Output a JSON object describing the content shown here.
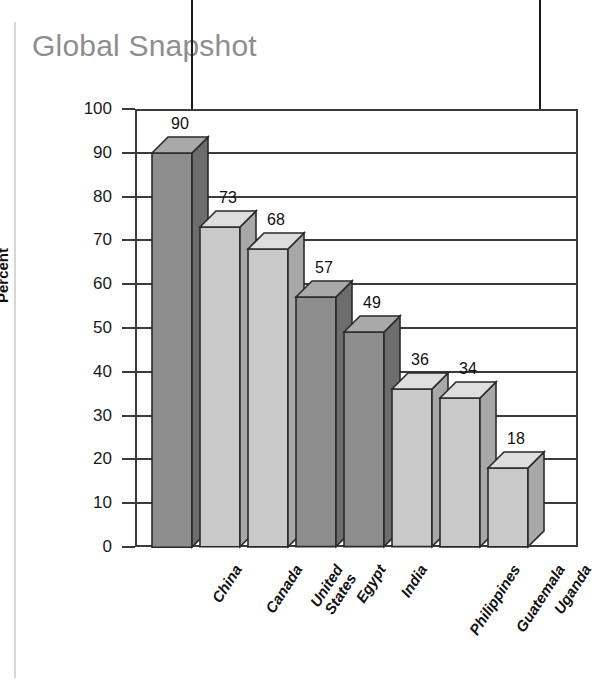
{
  "page": {
    "title": "Global Snapshot"
  },
  "annotations": [
    {
      "name": "arrow-left",
      "glyph": "down-arrow"
    },
    {
      "name": "arrow-right",
      "glyph": "down-arrow"
    }
  ],
  "chart_data": {
    "type": "bar",
    "title": "Global Snapshot",
    "xlabel": "",
    "ylabel": "Percent",
    "ylim": [
      0,
      100
    ],
    "yticks": [
      0,
      10,
      20,
      30,
      40,
      50,
      60,
      70,
      80,
      90,
      100
    ],
    "grid": true,
    "legend": null,
    "categories": [
      "China",
      "Canada",
      "United States",
      "Egypt",
      "India",
      "Philippines",
      "Guatemala",
      "Uganda"
    ],
    "values": [
      90,
      73,
      68,
      57,
      49,
      36,
      34,
      18
    ],
    "data_labels": [
      "90",
      "73",
      "68",
      "57",
      "49",
      "36",
      "34",
      "18"
    ],
    "bar_shades": [
      "dark",
      "light",
      "light",
      "dark",
      "dark",
      "light",
      "light",
      "light"
    ],
    "colors": {
      "dark_front": "#8d8d8d",
      "dark_top": "#a9a9a9",
      "dark_side": "#6d6d6d",
      "light_front": "#c9c9c9",
      "light_top": "#dedede",
      "light_side": "#a8a8a8",
      "outline": "#2a2a2a",
      "axis": "#3b3b3b",
      "title": "#8e8e8e",
      "text": "#111111"
    }
  }
}
